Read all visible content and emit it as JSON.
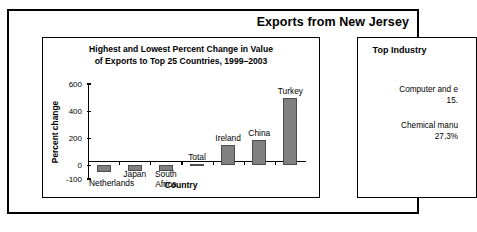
{
  "header": {
    "title": "Exports from New Jersey"
  },
  "chart_panel": {
    "title_line1": "Highest and Lowest Percent Change in Value",
    "title_line2": "of Exports to Top 25 Countries, 1999–2003"
  },
  "industry_panel": {
    "title": "Top Industry",
    "entries": [
      {
        "name": "Computer and e",
        "value": "15."
      },
      {
        "name": "Chemical manu",
        "value": "27.3%"
      }
    ]
  },
  "chart_data": {
    "type": "bar",
    "title": "Highest and Lowest Percent Change in Value of Exports to Top 25 Countries, 1999–2003",
    "xlabel": "Country",
    "ylabel": "Percent change",
    "categories": [
      "Netherlands",
      "Japan",
      "South Africa",
      "Total",
      "Ireland",
      "China",
      "Turkey"
    ],
    "values": [
      -45,
      -40,
      -40,
      10,
      150,
      190,
      500
    ],
    "ylim": [
      -100,
      600
    ],
    "yticks": [
      -100,
      0,
      200,
      400,
      600
    ],
    "ytick_labels": [
      "-100",
      "0",
      "200",
      "400",
      "600"
    ],
    "grid": false,
    "legend": false,
    "bar_color": "#808080"
  }
}
